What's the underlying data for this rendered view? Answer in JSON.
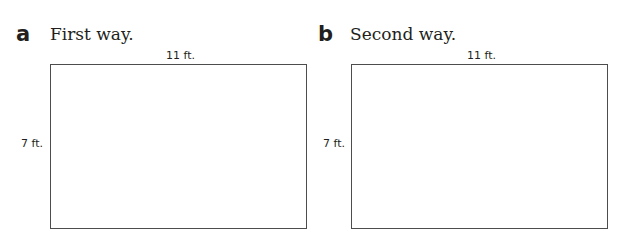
{
  "problems": [
    {
      "letter": "a",
      "heading": "First way.",
      "width_label": "11 ft.",
      "height_label": "7 ft."
    },
    {
      "letter": "b",
      "heading": "Second way.",
      "width_label": "11 ft.",
      "height_label": "7 ft."
    }
  ]
}
